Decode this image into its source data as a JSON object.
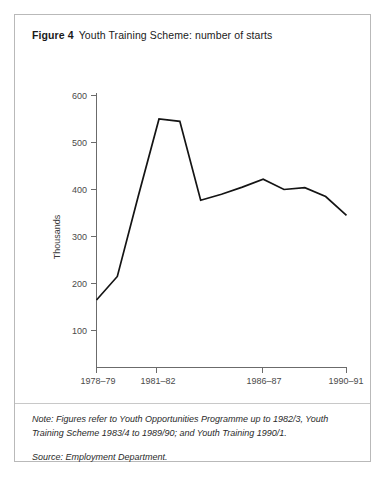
{
  "figure": {
    "number_label": "Figure 4",
    "title": "Youth Training Scheme: number of starts"
  },
  "notes": {
    "note": "Note: Figures refer to Youth Opportunities Programme up to 1982/3, Youth Training Scheme 1983/4 to 1989/90; and Youth Training 1990/1.",
    "source": "Source: Employment Department."
  },
  "chart_data": {
    "type": "line",
    "title": "Youth Training Scheme: number of starts",
    "xlabel": "",
    "ylabel": "Thousands",
    "ylim": [
      0,
      620
    ],
    "xlim": [
      1978,
      1990
    ],
    "grid": false,
    "legend": false,
    "y_ticks": [
      100,
      200,
      300,
      400,
      500,
      600
    ],
    "y_tick_labels": [
      "100",
      "200",
      "300",
      "400",
      "500",
      "600"
    ],
    "x_ticks": [
      1978,
      1981,
      1986,
      1990
    ],
    "x_tick_labels": [
      "1978–79",
      "1981–82",
      "1986–87",
      "1990–91"
    ],
    "x": [
      1978,
      1979,
      1980,
      1981,
      1982,
      1983,
      1984,
      1985,
      1986,
      1987,
      1988,
      1989,
      1990
    ],
    "values": [
      165,
      215,
      385,
      550,
      545,
      377,
      390,
      405,
      422,
      400,
      404,
      385,
      345
    ],
    "series": [
      {
        "name": "Number of starts",
        "color": "#141414",
        "values": [
          165,
          215,
          385,
          550,
          545,
          377,
          390,
          405,
          422,
          400,
          404,
          385,
          345
        ]
      }
    ]
  }
}
